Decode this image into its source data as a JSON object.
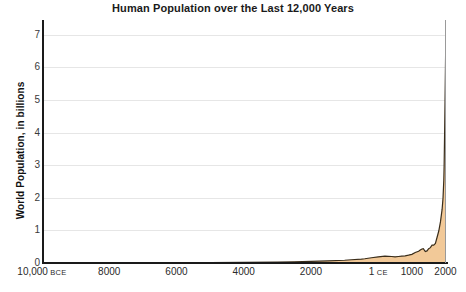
{
  "chart_data": {
    "type": "area",
    "title": "Human Population over the Last 12,000 Years",
    "xlabel": "",
    "ylabel": "World Population, in billions",
    "ylim": [
      0,
      7.45
    ],
    "xlim": [
      -10000,
      2015
    ],
    "grid": true,
    "legend": null,
    "series_name": "World Population",
    "colors": {
      "fill": "#f2c998",
      "stroke": "#3a2d1a",
      "gridline": "#e6e6e6",
      "axis": "#1a1a1a",
      "title_text": "#1a1a1a",
      "tick_text": "#2a2a2a"
    },
    "y_ticks": [
      "7",
      "6",
      "5",
      "4",
      "3",
      "2",
      "1",
      "0"
    ],
    "y_tick_values": [
      7,
      6,
      5,
      4,
      3,
      2,
      1,
      0
    ],
    "x_ticks": [
      {
        "label": "10,000",
        "era": "BCE",
        "value": -10000
      },
      {
        "label": "8000",
        "era": "",
        "value": -8000
      },
      {
        "label": "6000",
        "era": "",
        "value": -6000
      },
      {
        "label": "4000",
        "era": "",
        "value": -4000
      },
      {
        "label": "2000",
        "era": "",
        "value": -2000
      },
      {
        "label": "1",
        "era": "CE",
        "value": 1
      },
      {
        "label": "1000",
        "era": "",
        "value": 1000
      },
      {
        "label": "2000",
        "era": "",
        "value": 2000
      }
    ],
    "x": [
      -10000,
      -9000,
      -8000,
      -7000,
      -6000,
      -5000,
      -4000,
      -3000,
      -2500,
      -2000,
      -1500,
      -1000,
      -800,
      -500,
      -400,
      -200,
      1,
      200,
      400,
      500,
      600,
      700,
      800,
      900,
      1000,
      1100,
      1200,
      1250,
      1300,
      1340,
      1400,
      1450,
      1500,
      1550,
      1600,
      1650,
      1700,
      1750,
      1800,
      1850,
      1900,
      1927,
      1950,
      1960,
      1974,
      1987,
      1999,
      2011,
      2015
    ],
    "y": [
      0.004,
      0.005,
      0.005,
      0.007,
      0.01,
      0.015,
      0.02,
      0.025,
      0.035,
      0.05,
      0.065,
      0.085,
      0.1,
      0.12,
      0.13,
      0.16,
      0.19,
      0.21,
      0.2,
      0.19,
      0.2,
      0.21,
      0.22,
      0.24,
      0.265,
      0.32,
      0.36,
      0.4,
      0.43,
      0.44,
      0.35,
      0.37,
      0.44,
      0.47,
      0.55,
      0.55,
      0.6,
      0.79,
      0.98,
      1.26,
      1.65,
      2.0,
      2.54,
      3.0,
      4.0,
      5.0,
      6.0,
      7.0,
      7.4
    ],
    "annotations": []
  }
}
